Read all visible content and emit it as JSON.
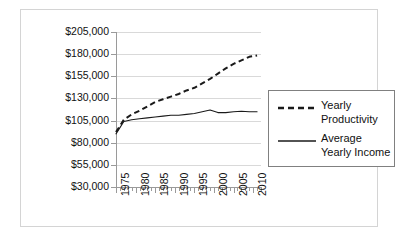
{
  "chart_data": {
    "type": "line",
    "title": "",
    "xlabel": "",
    "ylabel": "",
    "grid": true,
    "legend_position": "right",
    "xlim": [
      1975,
      2012
    ],
    "ylim": [
      30000,
      205000
    ],
    "y_ticks": [
      "$205,000",
      "$180,000",
      "$155,000",
      "$130,000",
      "$105,000",
      "$80,000",
      "$55,000",
      "$30,000"
    ],
    "y_tick_values": [
      205000,
      180000,
      155000,
      130000,
      105000,
      80000,
      55000,
      30000
    ],
    "x_ticks": [
      "1975",
      "1980",
      "1985",
      "1990",
      "1995",
      "2000",
      "2005",
      "2010"
    ],
    "x_tick_values": [
      1975,
      1980,
      1985,
      1990,
      1995,
      2000,
      2005,
      2010
    ],
    "series": [
      {
        "name": "Yearly Productivity",
        "style": "dashed",
        "color": "#1a1a1a",
        "x": [
          1975,
          1977,
          1979,
          1981,
          1983,
          1985,
          1987,
          1989,
          1991,
          1993,
          1995,
          1997,
          1999,
          2001,
          2003,
          2005,
          2007,
          2009,
          2011
        ],
        "values": [
          92000,
          106000,
          112000,
          116000,
          121000,
          126000,
          129000,
          132000,
          135000,
          139000,
          142000,
          147000,
          152000,
          158000,
          164000,
          169000,
          173000,
          177000,
          178500
        ]
      },
      {
        "name": "Average Yearly Income",
        "style": "solid",
        "color": "#1a1a1a",
        "x": [
          1975,
          1977,
          1979,
          1981,
          1983,
          1985,
          1987,
          1989,
          1991,
          1993,
          1995,
          1997,
          1999,
          2001,
          2003,
          2005,
          2007,
          2009,
          2011
        ],
        "values": [
          90000,
          104000,
          106000,
          107000,
          108000,
          109000,
          110000,
          111000,
          111000,
          112000,
          113000,
          115000,
          117000,
          114000,
          114000,
          115000,
          115500,
          115000,
          115000
        ]
      }
    ]
  },
  "legend": {
    "items": [
      {
        "label_line1": "Yearly",
        "label_line2": "Productivity",
        "style": "dashed"
      },
      {
        "label_line1": "Average",
        "label_line2": "Yearly Income",
        "style": "solid"
      }
    ]
  }
}
